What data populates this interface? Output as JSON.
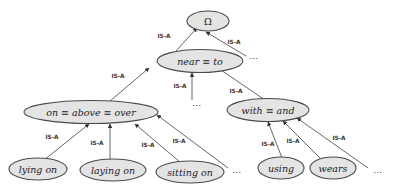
{
  "diagram": {
    "type": "taxonomy-tree",
    "relation_label": "IS-A",
    "colors": {
      "node_fill": "#e4e4e4",
      "node_stroke": "#4a4a4a",
      "edge": "#555555"
    },
    "nodes": {
      "root": {
        "label": "Ω"
      },
      "near": {
        "label": "near  ≡ to"
      },
      "on": {
        "label": "on  ≡ above ≡ over"
      },
      "with": {
        "label": "with ≡ and"
      },
      "lying_on": {
        "label": "lying on"
      },
      "laying_on": {
        "label": "laying on"
      },
      "sitting_on": {
        "label": "sitting on"
      },
      "using": {
        "label": "using"
      },
      "wears": {
        "label": "wears"
      }
    },
    "edges": [
      {
        "from": "near",
        "to": "root",
        "label": "IS-A"
      },
      {
        "from": "…",
        "to": "root",
        "label": "IS-A"
      },
      {
        "from": "on",
        "to": "near",
        "label": "IS-A"
      },
      {
        "from": "…",
        "to": "near",
        "label": "IS-A"
      },
      {
        "from": "with",
        "to": "near",
        "label": "IS-A"
      },
      {
        "from": "lying_on",
        "to": "on",
        "label": "IS-A"
      },
      {
        "from": "laying_on",
        "to": "on",
        "label": "IS-A"
      },
      {
        "from": "sitting_on",
        "to": "on",
        "label": "IS-A"
      },
      {
        "from": "…",
        "to": "on",
        "label": "IS-A"
      },
      {
        "from": "using",
        "to": "with",
        "label": "IS-A"
      },
      {
        "from": "wears",
        "to": "with",
        "label": "IS-A"
      },
      {
        "from": "…",
        "to": "with",
        "label": "IS-A"
      }
    ],
    "ellipsis": "…"
  }
}
